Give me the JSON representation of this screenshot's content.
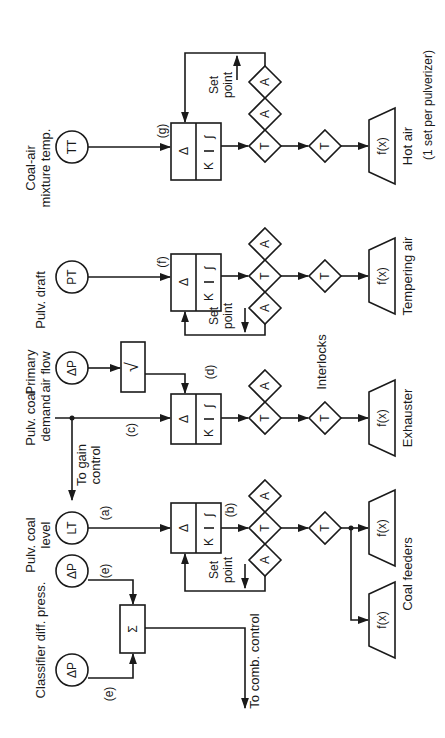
{
  "diagram": {
    "title_note": "(1 set per pulverizer)",
    "instruments": [
      {
        "id": "tt",
        "symbol": "TT",
        "label_line1": "Coal-air",
        "label_line2": "mixture temp."
      },
      {
        "id": "pt",
        "symbol": "PT",
        "label_line1": "Pulv. draft",
        "label_line2": ""
      },
      {
        "id": "dp_air",
        "symbol": "ΔP",
        "label_line1": "Primary",
        "label_line2": "air flow"
      },
      {
        "id": "demand",
        "symbol": "",
        "label_line1": "Pulv. coal",
        "label_line2": "demand"
      },
      {
        "id": "lt",
        "symbol": "LT",
        "label_line1": "Pulv. coal",
        "label_line2": "level"
      },
      {
        "id": "dp_e2",
        "symbol": "ΔP",
        "label_line1": "",
        "label_line2": ""
      },
      {
        "id": "dp_e1",
        "symbol": "ΔP",
        "label_line1": "Classifier diff. press.",
        "label_line2": ""
      }
    ],
    "tags": {
      "a": "(a)",
      "b": "(b)",
      "c": "(c)",
      "d": "(d)",
      "e1": "(e)",
      "e2": "(e)",
      "f": "(f)",
      "g": "(g)"
    },
    "controller": {
      "delta": "Δ",
      "gain": "K",
      "integral": "∫"
    },
    "sqrt_symbol": "√",
    "sum_symbol": "Σ",
    "transfer": "T",
    "auto": "A",
    "function": "f(x)",
    "setpoint_line1": "Set",
    "setpoint_line2": "point",
    "to_gain_control_line1": "To gain",
    "to_gain_control_line2": "control",
    "to_comb_control": "To comb. control",
    "interlocks": "Interlocks",
    "final_elements": {
      "hot_air": "Hot air",
      "tempering_air": "Tempering air",
      "exhauster": "Exhauster",
      "coal_feeders": "Coal feeders"
    }
  }
}
